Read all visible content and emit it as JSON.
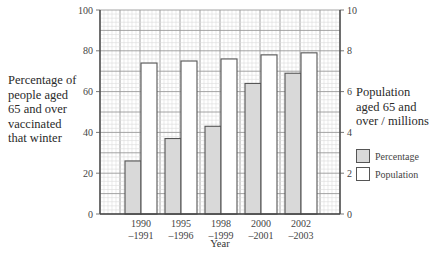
{
  "chart_data": {
    "type": "bar",
    "title": "",
    "xlabel": "Year",
    "ylabel": "Percentage of people aged 65 and over vaccinated that winter",
    "ylabel_right": "Population aged 65 and over / millions",
    "categories": [
      "1990 –1991",
      "1995 –1996",
      "1998 –1999",
      "2000 –2001",
      "2002 –2003"
    ],
    "category_lines": [
      [
        "1990",
        "–1991"
      ],
      [
        "1995",
        "–1996"
      ],
      [
        "1998",
        "–1999"
      ],
      [
        "2000",
        "–2001"
      ],
      [
        "2002",
        "–2003"
      ]
    ],
    "series": [
      {
        "name": "Percentage",
        "axis": "left",
        "color": "#d9d9d9",
        "values": [
          26,
          37,
          43,
          64,
          69
        ]
      },
      {
        "name": "Population",
        "axis": "right",
        "color": "#ffffff",
        "values": [
          7.4,
          7.5,
          7.6,
          7.8,
          7.9
        ]
      }
    ],
    "ylim": [
      0,
      100
    ],
    "ylim_right": [
      0,
      10
    ],
    "yticks": [
      0,
      20,
      40,
      60,
      80,
      100
    ],
    "yticks_right": [
      0,
      2,
      4,
      6,
      8,
      10
    ],
    "grid": true,
    "legend_position": "right"
  },
  "labels": {
    "ylabel_left_lines": [
      "Percentage of",
      "people aged",
      "65 and over",
      "vaccinated",
      "that winter"
    ],
    "ylabel_right_lines": [
      "Population",
      "aged 65 and",
      "over / millions"
    ],
    "xlabel": "Year",
    "legend": [
      "Percentage",
      "Population"
    ]
  }
}
